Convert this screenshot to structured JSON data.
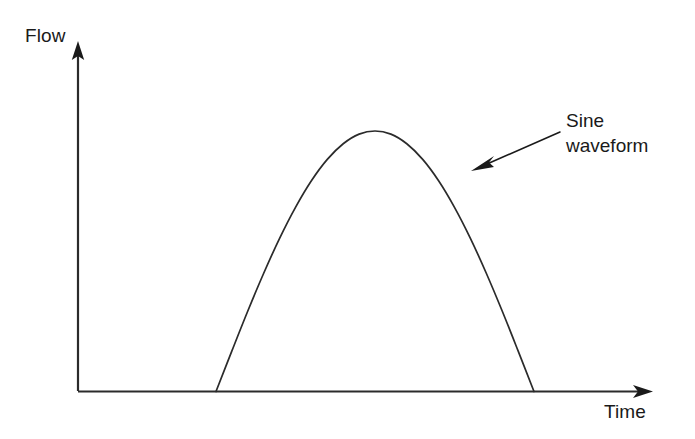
{
  "figure": {
    "type": "line-diagram",
    "background_color": "#ffffff",
    "stroke_color": "#1a1a1a",
    "axes": {
      "y_axis": {
        "label": "Flow",
        "icon": "arrow-up-icon",
        "origin": [
          78,
          391
        ],
        "tip": [
          78,
          43
        ]
      },
      "x_axis": {
        "label": "Time",
        "icon": "arrow-right-icon",
        "origin": [
          78,
          391
        ],
        "tip": [
          652,
          392
        ]
      }
    },
    "annotation": {
      "lines": [
        "Sine",
        "waveform"
      ],
      "line1": "Sine",
      "line2": "waveform",
      "pointer_icon": "arrow-left-icon",
      "pointer_from": [
        558,
        133
      ],
      "pointer_to": [
        474,
        170
      ]
    }
  },
  "chart_data": {
    "type": "line",
    "title": "",
    "xlabel": "Time",
    "ylabel": "Flow",
    "grid": false,
    "legend": null,
    "annotations": [
      {
        "text": "Sine waveform",
        "target": "curve",
        "arrow": true
      }
    ],
    "axis_ticks": {
      "x": [],
      "y": []
    },
    "xlim": [
      0,
      1
    ],
    "ylim": [
      0,
      1.15
    ],
    "series": [
      {
        "name": "Sine waveform",
        "description": "One positive half-cycle of a sine wave; flow is zero before onset and after termination.",
        "equation": "y = sin(pi * t) for 0 <= t <= 1, else 0",
        "x": [
          0.0,
          0.05,
          0.1,
          0.15,
          0.2,
          0.25,
          0.3,
          0.35,
          0.4,
          0.45,
          0.5,
          0.55,
          0.6,
          0.65,
          0.7,
          0.75,
          0.8,
          0.85,
          0.9,
          0.95,
          1.0
        ],
        "y": [
          0.0,
          0.156,
          0.309,
          0.454,
          0.588,
          0.707,
          0.809,
          0.891,
          0.951,
          0.988,
          1.0,
          0.988,
          0.951,
          0.891,
          0.809,
          0.707,
          0.588,
          0.454,
          0.309,
          0.156,
          0.0
        ]
      }
    ]
  }
}
